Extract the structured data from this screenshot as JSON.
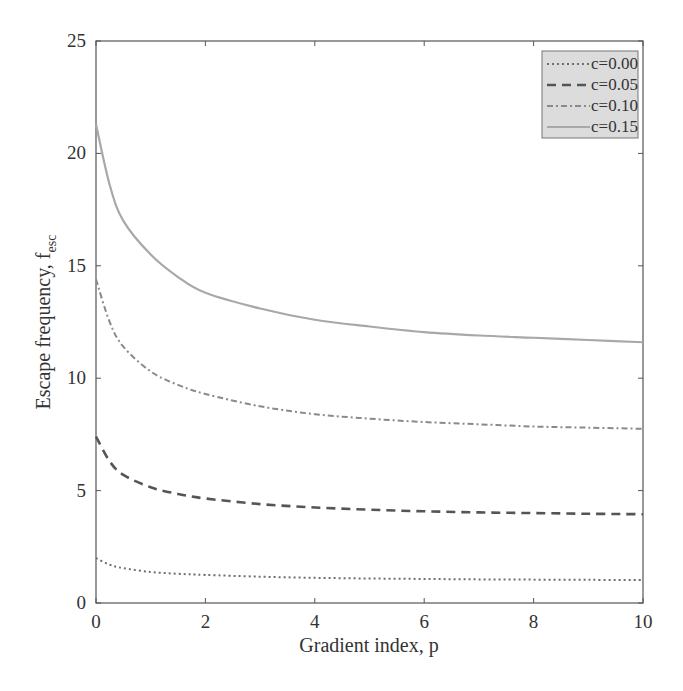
{
  "chart_data": {
    "type": "line",
    "title": "",
    "xlabel": "Gradient index, p",
    "ylabel_main": "Escape frequency, f",
    "ylabel_sub": "esc",
    "ylabel": "Escape frequency, f_esc",
    "xlim": [
      0,
      10
    ],
    "ylim": [
      0,
      25
    ],
    "x_ticks": [
      0,
      2,
      4,
      6,
      8,
      10
    ],
    "y_ticks": [
      0,
      5,
      10,
      15,
      20,
      25
    ],
    "grid": false,
    "legend_position": "upper right",
    "x": [
      0,
      0.25,
      0.5,
      1,
      1.5,
      2,
      3,
      4,
      5,
      6,
      7,
      8,
      9,
      10
    ],
    "series": [
      {
        "name": "c=0.00",
        "style": "dotted",
        "color": "#6e6e6e",
        "values": [
          2.0,
          1.7,
          1.55,
          1.38,
          1.3,
          1.25,
          1.17,
          1.12,
          1.09,
          1.07,
          1.05,
          1.04,
          1.03,
          1.02
        ]
      },
      {
        "name": "c=0.05",
        "style": "dashed",
        "color": "#555555",
        "values": [
          7.4,
          6.3,
          5.7,
          5.15,
          4.85,
          4.65,
          4.4,
          4.25,
          4.15,
          4.08,
          4.03,
          4.0,
          3.97,
          3.95
        ]
      },
      {
        "name": "c=0.10",
        "style": "dash-dot",
        "color": "#8a8a8a",
        "values": [
          14.4,
          12.5,
          11.4,
          10.3,
          9.7,
          9.3,
          8.75,
          8.4,
          8.2,
          8.05,
          7.95,
          7.85,
          7.8,
          7.75
        ]
      },
      {
        "name": "c=0.15",
        "style": "solid",
        "color": "#a8a8a8",
        "values": [
          21.3,
          18.6,
          17.0,
          15.5,
          14.5,
          13.8,
          13.1,
          12.6,
          12.3,
          12.05,
          11.9,
          11.8,
          11.7,
          11.6
        ]
      }
    ]
  }
}
